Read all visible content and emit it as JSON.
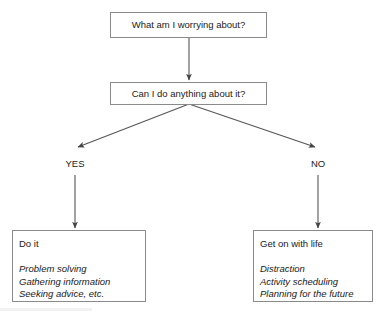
{
  "diagram": {
    "background_color": "#ffffff",
    "line_color": "#555555",
    "box_border_color": "#8a8a8a",
    "text_color": "#1a1a1a",
    "nodes": [
      {
        "id": "worry-question",
        "label": "What am I worrying about?",
        "type": "question"
      },
      {
        "id": "control-question",
        "label": "Can I do anything about it?",
        "type": "question"
      },
      {
        "id": "do-it",
        "heading": "Do it",
        "items": [
          "Problem solving",
          "Gathering information",
          "Seeking advice, etc."
        ],
        "type": "outcome"
      },
      {
        "id": "get-on-with-life",
        "heading": "Get on with life",
        "items": [
          "Distraction",
          "Activity scheduling",
          "Planning for the future"
        ],
        "type": "outcome"
      }
    ],
    "branch_labels": {
      "yes": "YES",
      "no": "NO"
    }
  }
}
